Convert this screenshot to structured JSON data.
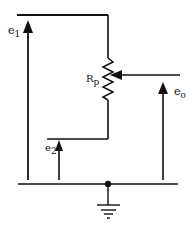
{
  "diagram": {
    "type": "circuit",
    "labels": {
      "e1": {
        "main": "e",
        "sub": "1"
      },
      "e2": {
        "main": "e",
        "sub": "2"
      },
      "eo": {
        "main": "e",
        "sub": "o"
      },
      "rp": {
        "main": "R",
        "sub": "p"
      }
    },
    "components": [
      "potentiometer R_p with wiper",
      "input voltage e1",
      "input voltage e2",
      "output voltage eo",
      "ground"
    ],
    "colors": {
      "line": "#111111",
      "background": "#ffffff"
    }
  }
}
